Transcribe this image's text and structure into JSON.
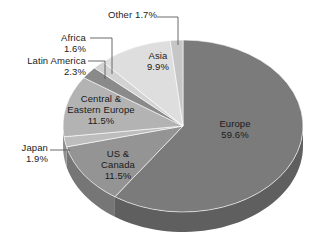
{
  "chart_data": {
    "type": "pie",
    "title": "",
    "subtitle": "",
    "xlabel": "",
    "ylabel": "",
    "legend_position": "none",
    "grid": false,
    "style": "3d-pie",
    "units": "percent",
    "categories": [
      "Europe",
      "US & Canada",
      "Japan",
      "Central & Eastern Europe",
      "Latin America",
      "Africa",
      "Asia",
      "Other"
    ],
    "values": [
      59.6,
      11.5,
      1.9,
      11.5,
      2.3,
      1.6,
      9.9,
      1.7
    ],
    "slices": [
      {
        "name": "Europe",
        "label": "Europe",
        "value": 59.6,
        "value_label": "59.6%",
        "color": "#7b7b7b",
        "side_color": "#5f5f5f",
        "label_placement": "inside"
      },
      {
        "name": "US & Canada",
        "label": "US &\nCanada",
        "label_line1": "US &",
        "label_line2": "Canada",
        "value": 11.5,
        "value_label": "11.5%",
        "color": "#949494",
        "side_color": "#767676",
        "label_placement": "inside"
      },
      {
        "name": "Japan",
        "label": "Japan",
        "value": 1.9,
        "value_label": "1.9%",
        "color": "#bdbdbd",
        "side_color": "#8f8f8f",
        "label_placement": "callout"
      },
      {
        "name": "Central & Eastern Europe",
        "label": "Central &\nEastern Europe",
        "label_line1": "Central &",
        "label_line2": "Eastern Europe",
        "value": 11.5,
        "value_label": "11.5%",
        "color": "#b3b3b3",
        "side_color": "#8d8d8d",
        "label_placement": "inside"
      },
      {
        "name": "Latin America",
        "label": "Latin America",
        "value": 2.3,
        "value_label": "2.3%",
        "color": "#8a8a8a",
        "side_color": "#6e6e6e",
        "label_placement": "callout"
      },
      {
        "name": "Africa",
        "label": "Africa",
        "value": 1.6,
        "value_label": "1.6%",
        "color": "#d2d2d2",
        "side_color": "#a5a5a5",
        "label_placement": "callout"
      },
      {
        "name": "Asia",
        "label": "Asia",
        "value": 9.9,
        "value_label": "9.9%",
        "color": "#dedede",
        "side_color": "#b0b0b0",
        "label_placement": "inside"
      },
      {
        "name": "Other",
        "label": "Other",
        "value": 1.7,
        "value_label": "1.7%",
        "color": "#c6c6c6",
        "side_color": "#9b9b9b",
        "label_placement": "callout"
      }
    ],
    "background_color": "#ffffff",
    "text_color": "#1c1c1c",
    "leader_line_color": "#5a5a5a"
  },
  "labels": {
    "other": {
      "text": "Other 1.7%"
    },
    "africa": {
      "line1": "Africa",
      "line2": "1.6%"
    },
    "latin_america": {
      "line1": "Latin America",
      "line2": "2.3%"
    },
    "asia": {
      "line1": "Asia",
      "line2": "9.9%"
    },
    "europe": {
      "line1": "Europe",
      "line2": "59.6%"
    },
    "central_eastern_europe": {
      "line1": "Central &",
      "line2": "Eastern Europe",
      "line3": "11.5%"
    },
    "japan": {
      "line1": "Japan",
      "line2": "1.9%"
    },
    "us_canada": {
      "line1": "US &",
      "line2": "Canada",
      "line3": "11.5%"
    }
  }
}
